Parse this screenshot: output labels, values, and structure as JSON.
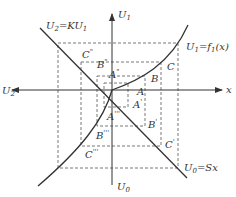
{
  "diagram": {
    "axes": {
      "x_right_label": "x",
      "x_left_label": "U",
      "x_left_sub": "2",
      "y_top_label": "U",
      "y_top_sub": "1",
      "y_bottom_label": "U",
      "y_bottom_sub": "0"
    },
    "curves": {
      "line_upper_left": {
        "label": "U",
        "sub": "2",
        "rest": "=KU",
        "rest_sub": "1"
      },
      "curve_upper_right": {
        "label": "U",
        "sub": "1",
        "rest": "=f",
        "rest_sub": "1",
        "tail": "(x)"
      },
      "line_lower_right": {
        "label": "U",
        "sub": "0",
        "rest": "=Sx"
      }
    },
    "points": {
      "A": "A",
      "B": "B",
      "C": "C",
      "A1": "A",
      "A1_mark": "'",
      "B1": "B",
      "B1_mark": "'",
      "C1": "C",
      "C1_mark": "'",
      "A2": "A",
      "A2_mark": "\"",
      "B2": "B",
      "B2_mark": "\"",
      "C2": "C",
      "C2_mark": "\"",
      "A3": "A",
      "A3_mark": "'''",
      "B3": "B",
      "B3_mark": "'''",
      "C3": "C",
      "C3_mark": "'''"
    },
    "colors": {
      "stroke": "#333333",
      "dash": "#555555",
      "background": "#ffffff"
    }
  }
}
